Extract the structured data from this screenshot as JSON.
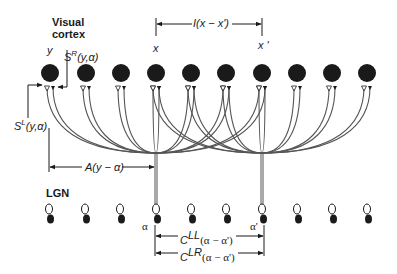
{
  "labels": {
    "visual_cortex_line1": "Visual",
    "visual_cortex_line2": "cortex",
    "lgn": "LGN",
    "y": "y",
    "x": "x",
    "x_prime": "x '",
    "alpha": "α",
    "alpha_prime": "α'",
    "s_right_base": "S",
    "s_right_sup": "R",
    "s_right_args": "(y,α)",
    "s_left_base": "S",
    "s_left_sup": "L",
    "s_left_args": "(y,α)",
    "interaction": "I(x − x')",
    "arbor": "A(y − α)",
    "c_ll_base": "C",
    "c_ll_sup": "LL",
    "c_ll_args": "(α − α')",
    "c_lr_base": "C",
    "c_lr_sup": "LR",
    "c_lr_args": "(α − α')"
  },
  "cortex": {
    "neuron_x": [
      50,
      86,
      121,
      156,
      191,
      226,
      262,
      297,
      332,
      367
    ],
    "neuron_y": 73,
    "neuron_radius": 9,
    "fill": "#1a1a1a"
  },
  "lgn": {
    "cell_x": [
      49,
      85,
      120,
      156,
      191,
      226,
      262,
      297,
      332,
      367
    ],
    "open_y": 209,
    "filled_y": 219,
    "highlight_indices": [
      3,
      6
    ]
  },
  "projections": [
    {
      "from_lgn_index": 3,
      "to_cortex_indices": [
        0,
        1,
        2,
        3,
        4,
        5,
        6
      ]
    },
    {
      "from_lgn_index": 6,
      "to_cortex_indices": [
        3,
        4,
        5,
        6,
        7,
        8,
        9
      ]
    }
  ],
  "colors": {
    "ink": "#1a1a1a",
    "axon": "#555555",
    "background": "#ffffff"
  }
}
